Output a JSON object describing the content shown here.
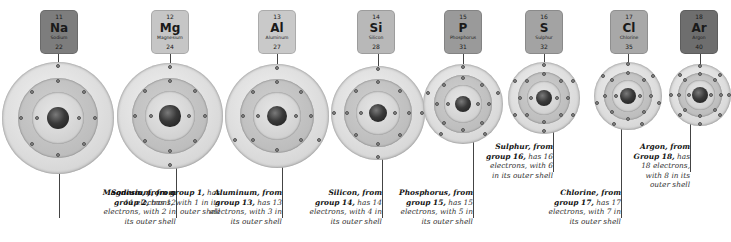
{
  "elements": [
    {
      "number": "11",
      "symbol": "Na",
      "name": "Sodium",
      "mass": "22",
      "box_color": "#7d7d7d",
      "caption": {
        "lead": "Sodium, from group 1,",
        "rest": " has 11 electrons, with 1 in its outer shell"
      },
      "shells": 3,
      "outer_electrons": 1
    },
    {
      "number": "12",
      "symbol": "Mg",
      "name": "Magnesium",
      "mass": "24",
      "box_color": "#c6c6c6",
      "caption": {
        "lead": "Magnesium, from group 2,",
        "rest": " has 12 electrons, with 2 in its outer shell"
      },
      "shells": 3,
      "outer_electrons": 2
    },
    {
      "number": "13",
      "symbol": "Al",
      "name": "Aluminum",
      "mass": "27",
      "box_color": "#c9c9c9",
      "caption": {
        "lead": "Aluminum, from group 13,",
        "rest": " has 13 electrons, with 3 in its outer shell"
      },
      "shells": 3,
      "outer_electrons": 3
    },
    {
      "number": "14",
      "symbol": "Si",
      "name": "Silicon",
      "mass": "28",
      "box_color": "#b8b8b8",
      "caption": {
        "lead": "Silicon, from group 14,",
        "rest": " has 14 electrons, with 4 in its outer shell"
      },
      "shells": 3,
      "outer_electrons": 4
    },
    {
      "number": "15",
      "symbol": "P",
      "name": "Phosphorus",
      "mass": "31",
      "box_color": "#9a9a9a",
      "caption": {
        "lead": "Phosphorus, from group 15,",
        "rest": " has 15 electrons, with 5 in its outer shell"
      },
      "shells": 3,
      "outer_electrons": 5
    },
    {
      "number": "16",
      "symbol": "S",
      "name": "Sulphur",
      "mass": "32",
      "box_color": "#a3a3a3",
      "caption": {
        "lead": "Sulphur, from group 16,",
        "rest": " has 16 electrons, with 6 in its outer shell"
      },
      "shells": 3,
      "outer_electrons": 6
    },
    {
      "number": "17",
      "symbol": "Cl",
      "name": "Chlorine",
      "mass": "35",
      "box_color": "#a8a8a8",
      "caption": {
        "lead": "Chlorine, from group 17,",
        "rest": " has 17 electrons, with 7 in its outer shell"
      },
      "shells": 3,
      "outer_electrons": 7
    },
    {
      "number": "18",
      "symbol": "Ar",
      "name": "Argon",
      "mass": "40",
      "box_color": "#6e6e6e",
      "caption": {
        "lead": "Argon, from Group 18,",
        "rest": " has 18 electrons, with 8 in its outer shell"
      },
      "shells": 3,
      "outer_electrons": 8
    }
  ]
}
